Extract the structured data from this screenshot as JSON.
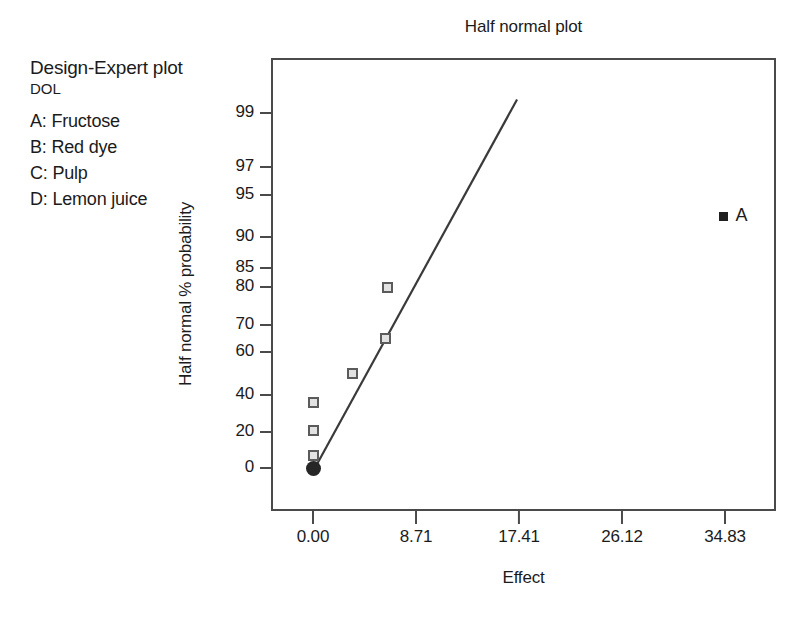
{
  "legend": {
    "software_title": "Design-Expert plot",
    "response": "DOL",
    "factors": [
      "A: Fructose",
      "B: Red dye",
      "C: Pulp",
      "D: Lemon juice"
    ]
  },
  "chart_data": {
    "type": "scatter",
    "title": "Half normal plot",
    "xlabel": "Effect",
    "ylabel": "Half normal % probability",
    "grid": false,
    "legend_position": "outside-top-left",
    "xlim": [
      -1.5,
      39.0
    ],
    "xticks": [
      "0.00",
      "8.71",
      "17.41",
      "26.12",
      "34.83"
    ],
    "xtick_values": [
      0.0,
      8.71,
      17.41,
      26.12,
      34.83
    ],
    "ylim": [
      0,
      99.5
    ],
    "yticks": [
      "99",
      "97",
      "95",
      "90",
      "85",
      "80",
      "70",
      "60",
      "40",
      "20",
      "0"
    ],
    "ytick_values": [
      99,
      97,
      95,
      90,
      85,
      80,
      70,
      60,
      40,
      20,
      0
    ],
    "ytick_scale": "half-normal-probability",
    "series": [
      {
        "name": "insignificant effects",
        "marker": "open-square",
        "color": "#5b5b5b",
        "points": [
          {
            "x": 0.0,
            "y": 7,
            "label": ""
          },
          {
            "x": 0.0,
            "y": 21,
            "label": ""
          },
          {
            "x": 0.0,
            "y": 36,
            "label": ""
          },
          {
            "x": 3.3,
            "y": 50,
            "label": ""
          },
          {
            "x": 6.15,
            "y": 65,
            "label": ""
          },
          {
            "x": 6.3,
            "y": 80,
            "label": ""
          }
        ]
      },
      {
        "name": "origin point",
        "marker": "filled-circle",
        "color": "#262626",
        "points": [
          {
            "x": 0.0,
            "y": 0,
            "label": ""
          }
        ]
      },
      {
        "name": "significant effects",
        "marker": "filled-square",
        "color": "#1f1f1f",
        "points": [
          {
            "x": 34.7,
            "y": 92.5,
            "label": "A"
          }
        ]
      }
    ],
    "reference_line": {
      "name": "half-normal-reference-line",
      "from": {
        "x": 0.0,
        "y": 0
      },
      "to": {
        "x": 17.25,
        "y": 99.5
      },
      "color": "#3a3a3a"
    }
  }
}
